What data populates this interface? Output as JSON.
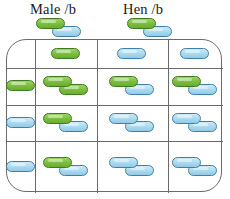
{
  "figure": {
    "type": "genetic-cross-grid",
    "headings": {
      "male": "Male /b",
      "hen": "Hen /b"
    },
    "colors": {
      "green_fill": "#79bd3c",
      "green_stroke": "#3f7a1f",
      "blue_fill": "#a9d9ef",
      "blue_stroke": "#3f7fa8",
      "rule": "#6a6a6a",
      "text": "#1a1a1a",
      "background": "#ffffff"
    },
    "parent_gametes": [
      {
        "name": "male-gamete-pair",
        "pills": [
          "green",
          "blue"
        ]
      },
      {
        "name": "hen-gamete-pair",
        "pills": [
          "green",
          "blue"
        ]
      }
    ],
    "grid": {
      "columns": 4,
      "rows": 4,
      "column_edges_px": [
        6,
        34,
        96,
        167,
        222
      ],
      "row_edges_px": [
        39,
        67,
        104,
        140,
        192
      ],
      "cells": [
        [
          {
            "name": "corner-cell",
            "pills": []
          },
          {
            "name": "male-gamete-green",
            "pills": [
              "green"
            ]
          },
          {
            "name": "male-gamete-blue-1",
            "pills": [
              "blue"
            ]
          },
          {
            "name": "male-gamete-blue-2",
            "pills": [
              "blue"
            ]
          }
        ],
        [
          {
            "name": "hen-gamete-green",
            "pills": [
              "green"
            ]
          },
          {
            "name": "offspring-r2c2",
            "pills": [
              "green",
              "green"
            ]
          },
          {
            "name": "offspring-r2c3",
            "pills": [
              "green",
              "blue"
            ]
          },
          {
            "name": "offspring-r2c4",
            "pills": [
              "green",
              "blue"
            ]
          }
        ],
        [
          {
            "name": "hen-gamete-blue-1",
            "pills": [
              "blue"
            ]
          },
          {
            "name": "offspring-r3c2",
            "pills": [
              "green",
              "blue"
            ]
          },
          {
            "name": "offspring-r3c3",
            "pills": [
              "blue",
              "blue"
            ]
          },
          {
            "name": "offspring-r3c4",
            "pills": [
              "blue",
              "blue"
            ]
          }
        ],
        [
          {
            "name": "hen-gamete-blue-2",
            "pills": [
              "blue"
            ]
          },
          {
            "name": "offspring-r4c2",
            "pills": [
              "green",
              "blue"
            ]
          },
          {
            "name": "offspring-r4c3",
            "pills": [
              "blue",
              "blue"
            ]
          },
          {
            "name": "offspring-r4c4",
            "pills": [
              "blue",
              "blue"
            ]
          }
        ]
      ]
    }
  }
}
